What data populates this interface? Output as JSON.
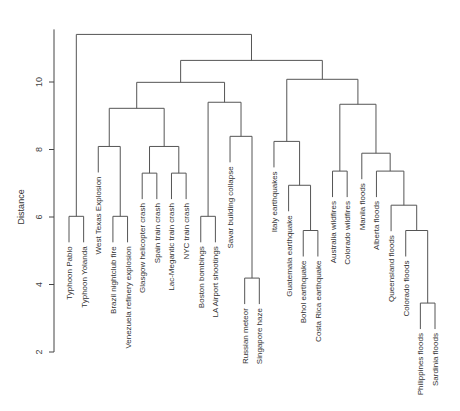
{
  "chart_data": {
    "type": "dendrogram",
    "title": "",
    "xlabel": "",
    "ylabel": "Distance",
    "ylim": [
      2,
      11.5
    ],
    "yticks": [
      2,
      4,
      6,
      8,
      10
    ],
    "leaves": [
      "Typhoon Pablo",
      "Typhoon Yolanda",
      "West Texas Explosion",
      "Brazil nightclub fire",
      "Venezuela refinery explosion",
      "Glasgow helicopter crash",
      "Spain train crash",
      "Lac-Megantic train crash",
      "NYC train crash",
      "Boston bombings",
      "LA Airport shootings",
      "Savar building collapse",
      "Russian meteor",
      "Singapore haze",
      "Italy earthquakes",
      "Guatemala earthquake",
      "Bohol earthquake",
      "Costa Rica earthquake",
      "Australia wildfires",
      "Colorado wildfires",
      "Manila floods",
      "Alberta floods",
      "Queensland floods",
      "Colorado floods",
      "Philippines floods",
      "Sardinia floods"
    ],
    "merges": [
      {
        "id": "m1",
        "left": "L0",
        "right": "L1",
        "height": 6.02
      },
      {
        "id": "m2",
        "left": "L3",
        "right": "L4",
        "height": 6.02
      },
      {
        "id": "m3",
        "left": "L2",
        "right": "m2",
        "height": 8.09
      },
      {
        "id": "m4",
        "left": "L5",
        "right": "L6",
        "height": 7.3
      },
      {
        "id": "m5",
        "left": "L7",
        "right": "L8",
        "height": 7.3
      },
      {
        "id": "m6",
        "left": "m4",
        "right": "m5",
        "height": 8.09
      },
      {
        "id": "m7",
        "left": "m3",
        "right": "m6",
        "height": 9.22
      },
      {
        "id": "m8",
        "left": "L9",
        "right": "L10",
        "height": 6.02
      },
      {
        "id": "m9",
        "left": "L12",
        "right": "L13",
        "height": 4.19
      },
      {
        "id": "m10",
        "left": "L11",
        "right": "m9",
        "height": 8.39
      },
      {
        "id": "m11",
        "left": "m8",
        "right": "m10",
        "height": 9.4
      },
      {
        "id": "m12",
        "left": "m7",
        "right": "m11",
        "height": 9.99
      },
      {
        "id": "m13",
        "left": "L16",
        "right": "L17",
        "height": 5.6
      },
      {
        "id": "m14",
        "left": "L15",
        "right": "m13",
        "height": 6.94
      },
      {
        "id": "m15",
        "left": "L14",
        "right": "m14",
        "height": 8.24
      },
      {
        "id": "m16",
        "left": "L18",
        "right": "L19",
        "height": 7.36
      },
      {
        "id": "m17",
        "left": "L24",
        "right": "L25",
        "height": 3.45
      },
      {
        "id": "m18",
        "left": "L23",
        "right": "m17",
        "height": 5.6
      },
      {
        "id": "m19",
        "left": "L22",
        "right": "m18",
        "height": 6.35
      },
      {
        "id": "m20",
        "left": "L21",
        "right": "m19",
        "height": 7.36
      },
      {
        "id": "m21",
        "left": "L20",
        "right": "m20",
        "height": 7.89
      },
      {
        "id": "m22",
        "left": "m16",
        "right": "m21",
        "height": 9.34
      },
      {
        "id": "m23",
        "left": "m15",
        "right": "m22",
        "height": 10.08
      },
      {
        "id": "m24",
        "left": "m12",
        "right": "m23",
        "height": 10.64
      },
      {
        "id": "m25",
        "left": "m1",
        "right": "m24",
        "height": 11.41
      }
    ],
    "grid": false,
    "legend": null
  },
  "axis": {
    "ylabel": "Distance",
    "tick_labels": [
      "2",
      "4",
      "6",
      "8",
      "10"
    ]
  },
  "style": {
    "line_color": "#555555",
    "axis_color": "#444444",
    "text_color": "#333333"
  }
}
